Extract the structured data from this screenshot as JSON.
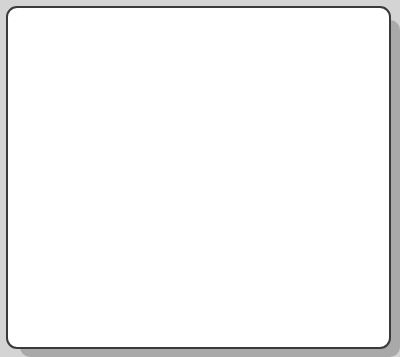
{
  "canvas": {
    "background_color": "#d4d4d4",
    "shadow_color": "#a9a9a9",
    "sheet_color": "#ffffff",
    "border_color": "#3a3a3a"
  },
  "grid": {
    "line_color": "#8a8a8a",
    "vertical_x": [
      61,
      116,
      171,
      226,
      280,
      334
    ],
    "horizontal_y": [
      63,
      120,
      177,
      233,
      290
    ],
    "columns": 7,
    "rows": 6
  },
  "shapes": [
    {
      "type": "ellipse",
      "label": "small-ellipse",
      "cx": 203,
      "cy": 68,
      "rx": 18,
      "ry": 27,
      "stroke": "#2a2a2a"
    },
    {
      "type": "ellipse",
      "label": "large-ellipse",
      "cx": 197,
      "cy": 147,
      "rx": 26,
      "ry": 40,
      "stroke": "#2a2a2a"
    }
  ]
}
